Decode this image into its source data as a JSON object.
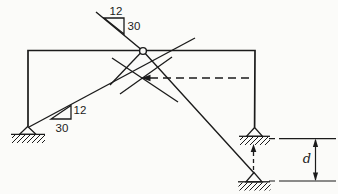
{
  "figure": {
    "colors": {
      "ink": "#1b1b1b",
      "background": "#fbfbf9"
    },
    "slope_triangle_top": {
      "run_label": "12",
      "rise_label": "30"
    },
    "slope_triangle_bottom": {
      "rise_label": "12",
      "run_label": "30"
    },
    "dimension_label": "d"
  }
}
